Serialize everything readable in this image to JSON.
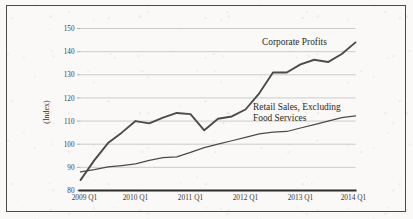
{
  "figure": {
    "name": "corporate-profits-vs-retail-sales-chart",
    "background_color": "#faf9f7",
    "frame_color": "#4a4a4a",
    "line_color": "#4d4b49"
  },
  "chart_data": {
    "type": "line",
    "title": "",
    "subtitle": "",
    "xlabel": "",
    "ylabel": "(Index)",
    "ylim": [
      80,
      150
    ],
    "xlim": [
      "2009 Q1",
      "2014 Q1"
    ],
    "grid": true,
    "legend_position": "inline-annotation",
    "y_ticks": [
      80,
      90,
      100,
      110,
      120,
      130,
      140,
      150
    ],
    "y_tick_labels": [
      "80",
      "90",
      "100",
      "110",
      "120",
      "130",
      "140",
      "150"
    ],
    "x_ticks": [
      "2009 Q1",
      "2010 Q1",
      "2011 Q1",
      "2012 Q1",
      "2013 Q1",
      "2014 Q1"
    ],
    "x_tick_labels": [
      "2009 Q1",
      "2010 Q1",
      "2011 Q1",
      "2012 Q1",
      "2013 Q1",
      "2014 Q1"
    ],
    "x": [
      "2009 Q1",
      "2009 Q2",
      "2009 Q3",
      "2009 Q4",
      "2010 Q1",
      "2010 Q2",
      "2010 Q3",
      "2010 Q4",
      "2011 Q1",
      "2011 Q2",
      "2011 Q3",
      "2011 Q4",
      "2012 Q1",
      "2012 Q2",
      "2012 Q3",
      "2012 Q4",
      "2013 Q1",
      "2013 Q2",
      "2013 Q3",
      "2013 Q4",
      "2014 Q1"
    ],
    "series": [
      {
        "name": "Corporate Profits",
        "label": "Corporate Profits",
        "label_line1": "Corporate Profits",
        "values": [
          84.5,
          93.0,
          100.5,
          105.0,
          110.0,
          109.0,
          111.5,
          113.5,
          113.0,
          106.0,
          111.0,
          112.0,
          115.0,
          122.0,
          131.0,
          131.0,
          134.5,
          136.5,
          135.5,
          139.0,
          144.0
        ]
      },
      {
        "name": "Retail Sales, Excluding Food Services",
        "label": "Retail Sales, Excluding Food Services",
        "label_line1": "Retail Sales, Excluding",
        "label_line2": "Food Services",
        "values": [
          88.0,
          89.0,
          90.2,
          90.8,
          91.5,
          93.0,
          94.2,
          94.5,
          96.5,
          98.5,
          100.0,
          101.5,
          103.0,
          104.5,
          105.2,
          105.5,
          107.0,
          108.5,
          110.0,
          111.5,
          112.2
        ]
      }
    ]
  }
}
